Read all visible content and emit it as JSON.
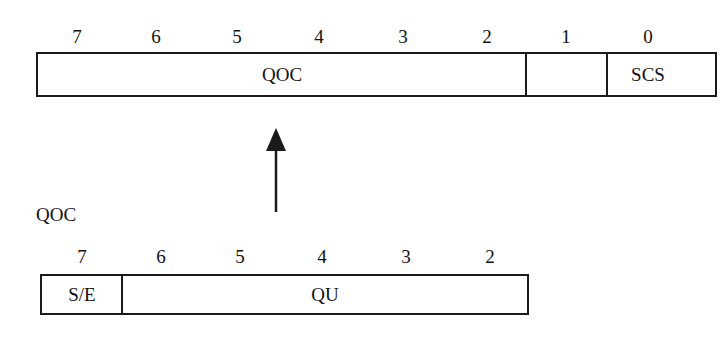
{
  "top_register": {
    "bit_labels": [
      "7",
      "6",
      "5",
      "4",
      "3",
      "2",
      "1",
      "0"
    ],
    "fields": [
      {
        "name": "QOC",
        "bits": "7-2"
      },
      {
        "name": "",
        "bits": "1"
      },
      {
        "name": "SCS",
        "bits": "0"
      }
    ]
  },
  "arrow": {
    "direction": "up",
    "meaning": "QOC field expands to"
  },
  "bottom_caption": "QOC",
  "bottom_register": {
    "bit_labels": [
      "7",
      "6",
      "5",
      "4",
      "3",
      "2"
    ],
    "fields": [
      {
        "name": "S/E",
        "bits": "7"
      },
      {
        "name": "QU",
        "bits": "6-2"
      }
    ]
  },
  "colors": {
    "line": "#1a1a1a",
    "background": "#ffffff"
  }
}
